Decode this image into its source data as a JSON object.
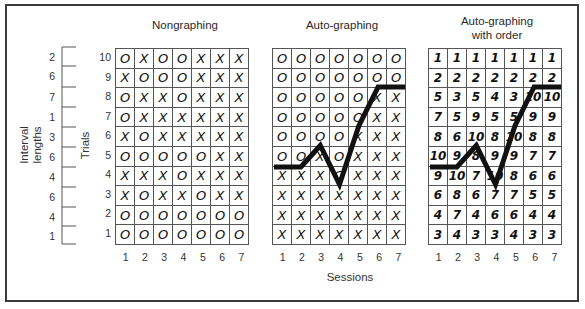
{
  "figure": {
    "x_axis_label": "Sessions",
    "trials_label": "Trials",
    "interval_label_line1": "Interval",
    "interval_label_line2": "lengths",
    "trials": [
      "10",
      "9",
      "8",
      "7",
      "6",
      "5",
      "4",
      "3",
      "2",
      "1"
    ],
    "interval_lengths": [
      "2",
      "6",
      "7",
      "1",
      "3",
      "6",
      "4",
      "6",
      "4",
      "1"
    ],
    "sessions": [
      "1",
      "2",
      "3",
      "4",
      "5",
      "6",
      "7"
    ]
  },
  "panels": [
    {
      "title_line1": "Nongraphing",
      "title_line2": "",
      "rows": [
        [
          "O",
          "X",
          "O",
          "O",
          "X",
          "X",
          "X"
        ],
        [
          "X",
          "O",
          "O",
          "O",
          "X",
          "X",
          "X"
        ],
        [
          "O",
          "X",
          "X",
          "O",
          "X",
          "X",
          "X"
        ],
        [
          "O",
          "X",
          "X",
          "X",
          "X",
          "X",
          "X"
        ],
        [
          "X",
          "O",
          "X",
          "X",
          "X",
          "X",
          "X"
        ],
        [
          "O",
          "O",
          "O",
          "O",
          "O",
          "X",
          "X"
        ],
        [
          "X",
          "X",
          "X",
          "O",
          "X",
          "X",
          "X"
        ],
        [
          "X",
          "O",
          "X",
          "X",
          "O",
          "X",
          "X"
        ],
        [
          "O",
          "O",
          "O",
          "O",
          "O",
          "O",
          "O"
        ],
        [
          "O",
          "O",
          "O",
          "O",
          "O",
          "O",
          "O"
        ]
      ]
    },
    {
      "title_line1": "Auto-graphing",
      "title_line2": "",
      "rows": [
        [
          "O",
          "O",
          "O",
          "O",
          "O",
          "O",
          "O"
        ],
        [
          "O",
          "O",
          "O",
          "O",
          "O",
          "O",
          "O"
        ],
        [
          "O",
          "O",
          "O",
          "O",
          "O",
          "X",
          "X"
        ],
        [
          "O",
          "O",
          "O",
          "O",
          "O",
          "X",
          "X"
        ],
        [
          "O",
          "O",
          "O",
          "O",
          "X",
          "X",
          "X"
        ],
        [
          "O",
          "O",
          "X",
          "O",
          "X",
          "X",
          "X"
        ],
        [
          "X",
          "X",
          "X",
          "O",
          "X",
          "X",
          "X"
        ],
        [
          "X",
          "X",
          "X",
          "X",
          "X",
          "X",
          "X"
        ],
        [
          "X",
          "X",
          "X",
          "X",
          "X",
          "X",
          "X"
        ],
        [
          "X",
          "X",
          "X",
          "X",
          "X",
          "X",
          "X"
        ]
      ],
      "graph_line": [
        4,
        4,
        5,
        3,
        6,
        8,
        8
      ]
    },
    {
      "title_line1": "Auto-graphing",
      "title_line2": "with order",
      "rows": [
        [
          "1",
          "1",
          "1",
          "1",
          "1",
          "1",
          "1"
        ],
        [
          "2",
          "2",
          "2",
          "2",
          "2",
          "2",
          "2"
        ],
        [
          "5",
          "3",
          "5",
          "4",
          "3",
          "10",
          "10"
        ],
        [
          "7",
          "5",
          "9",
          "5",
          "5",
          "9",
          "9"
        ],
        [
          "8",
          "6",
          "10",
          "8",
          "10",
          "8",
          "8"
        ],
        [
          "10",
          "9",
          "8",
          "9",
          "9",
          "7",
          "7"
        ],
        [
          "9",
          "10",
          "7",
          "10",
          "8",
          "6",
          "6"
        ],
        [
          "6",
          "8",
          "6",
          "7",
          "7",
          "5",
          "5"
        ],
        [
          "4",
          "7",
          "4",
          "6",
          "6",
          "4",
          "4"
        ],
        [
          "3",
          "4",
          "3",
          "3",
          "4",
          "3",
          "3"
        ]
      ],
      "graph_line": [
        4,
        4,
        5,
        3,
        6,
        8,
        8
      ]
    }
  ],
  "colors": {
    "line": "#111111",
    "grid": "#555555",
    "frame": "#3a3a3a"
  }
}
